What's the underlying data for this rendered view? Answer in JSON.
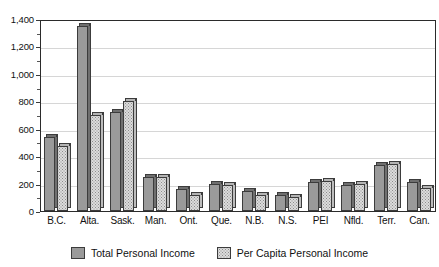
{
  "chart_data": {
    "type": "bar",
    "title": "",
    "subtitle": "",
    "xlabel": "",
    "ylabel": "",
    "ylim": [
      0,
      1400
    ],
    "ytick_step": 200,
    "yticks": [
      "0",
      "200",
      "400",
      "600",
      "800",
      "1,000",
      "1,200",
      "1,400"
    ],
    "grid": true,
    "legend_position": "bottom-center",
    "categories": [
      "B.C.",
      "Alta.",
      "Sask.",
      "Man.",
      "Ont.",
      "Que.",
      "N.B.",
      "N.S.",
      "PEI",
      "Nfld.",
      "Terr.",
      "Can."
    ],
    "series": [
      {
        "name": "Total Personal Income",
        "color": "#9a9a9a",
        "values": [
          540,
          1349,
          725,
          250,
          160,
          195,
          145,
          115,
          215,
          190,
          335,
          215
        ]
      },
      {
        "name": "Per Capita Personal Income",
        "color": "#dcdcdc",
        "values": [
          475,
          700,
          805,
          250,
          115,
          190,
          120,
          100,
          220,
          195,
          340,
          165
        ]
      }
    ]
  },
  "legend": {
    "items": [
      {
        "label": "Total Personal Income",
        "swatch": "series-a-swatch"
      },
      {
        "label": "Per Capita Personal Income",
        "swatch": "series-b-swatch"
      }
    ]
  }
}
